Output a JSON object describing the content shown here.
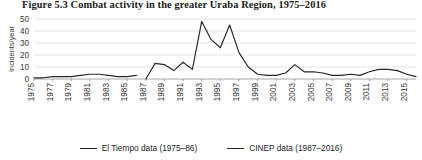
{
  "figure": {
    "title": "Figure 5.3  Combat activity in the greater Uraba Region, 1975–2016"
  },
  "legend": {
    "items": [
      {
        "label": "El Tiempo data (1975–86)",
        "color": "#262626"
      },
      {
        "label": "CINEP data (1987–2016)",
        "color": "#262626"
      }
    ]
  },
  "chart_data": {
    "type": "line",
    "title": "Figure 5.3  Combat activity in the greater Uraba Region, 1975–2016",
    "xlabel": "",
    "ylabel": "Incidents/year",
    "xlim": [
      1975,
      2016
    ],
    "ylim": [
      0,
      50
    ],
    "yticks": [
      0,
      10,
      20,
      30,
      40,
      50
    ],
    "ytick_labels": [
      "0",
      "10",
      "20",
      "30",
      "40",
      "50"
    ],
    "xticks": [
      1975,
      1977,
      1979,
      1981,
      1983,
      1985,
      1987,
      1989,
      1991,
      1993,
      1995,
      1997,
      1999,
      2001,
      2003,
      2005,
      2007,
      2009,
      2011,
      2013,
      2015
    ],
    "xtick_labels": [
      "1975",
      "1977",
      "1979",
      "1981",
      "1983",
      "1985",
      "1987",
      "1989",
      "1991",
      "1993",
      "1995",
      "1997",
      "1999",
      "2001",
      "2003",
      "2005",
      "2007",
      "2009",
      "2011",
      "2013",
      "2015"
    ],
    "grid": true,
    "grid_axis": "y",
    "legend_position": "bottom-center",
    "series": [
      {
        "name": "El Tiempo data (1975–86)",
        "color": "#262626",
        "x": [
          1975,
          1976,
          1977,
          1978,
          1979,
          1980,
          1981,
          1982,
          1983,
          1984,
          1985,
          1986
        ],
        "values": [
          1,
          1,
          2,
          2,
          2,
          3,
          4,
          4,
          3,
          2,
          2,
          3
        ]
      },
      {
        "name": "CINEP data (1987–2016)",
        "color": "#262626",
        "x": [
          1987,
          1988,
          1989,
          1990,
          1991,
          1992,
          1993,
          1994,
          1995,
          1996,
          1997,
          1998,
          1999,
          2000,
          2001,
          2002,
          2003,
          2004,
          2005,
          2006,
          2007,
          2008,
          2009,
          2010,
          2011,
          2012,
          2013,
          2014,
          2015,
          2016
        ],
        "values": [
          0,
          13,
          12,
          7,
          14,
          8,
          48,
          33,
          26,
          45,
          22,
          10,
          4,
          3,
          3,
          5,
          12,
          6,
          6,
          5,
          3,
          3,
          4,
          3,
          6,
          8,
          8,
          7,
          4,
          2
        ]
      }
    ]
  }
}
